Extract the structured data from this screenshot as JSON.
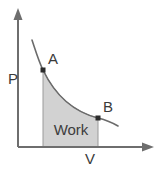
{
  "figure": {
    "background_color": "#ffffff"
  },
  "axes": {
    "y_label": "P",
    "x_label": "V",
    "axis_color": "#6e6e6e",
    "x_axis": {
      "start_x": 18,
      "end_x": 152,
      "y": 147
    },
    "y_axis": {
      "x": 18,
      "start_y": 147,
      "end_y": 10
    }
  },
  "curve": {
    "color": "#6b6b6b",
    "style": "solid",
    "shape": "isothermal-hyperbola",
    "path": "M 32 40 C 36 52, 39 62, 43 70 C 55 95, 74 112, 98 118 C 106 120, 113 123, 118 126"
  },
  "points": [
    {
      "id": "A",
      "label": "A",
      "x": 43,
      "y": 70,
      "label_x": 48,
      "label_y": 64,
      "color": "#2b2b2b"
    },
    {
      "id": "B",
      "label": "B",
      "x": 98,
      "y": 118,
      "label_x": 103,
      "label_y": 112,
      "color": "#2b2b2b"
    }
  ],
  "shaded_area": {
    "label": "Work",
    "fill_color": "#d2d2d2",
    "stroke_color": "#9a9a9a",
    "label_x": 71,
    "label_y": 135,
    "left_x": 43,
    "right_x": 98,
    "baseline_y": 147,
    "path": "M 43 70 C 55 95, 74 112, 98 118 L 98 147 L 43 147 Z"
  },
  "labels": {
    "p_x": 8,
    "p_y": 84,
    "v_x": 85,
    "v_y": 164
  },
  "chart_data": {
    "type": "line",
    "title": "",
    "xlabel": "V",
    "ylabel": "P",
    "annotations": [
      "A",
      "B",
      "Work"
    ],
    "series": [
      {
        "name": "isotherm",
        "x": [
          32,
          43,
          55,
          70,
          85,
          98,
          110,
          118
        ],
        "y": [
          40,
          70,
          92,
          106,
          114,
          118,
          123,
          126
        ]
      }
    ],
    "shaded_region": {
      "name": "Work",
      "x_from": 43,
      "x_to": 98
    },
    "grid": false,
    "legend": "none"
  }
}
